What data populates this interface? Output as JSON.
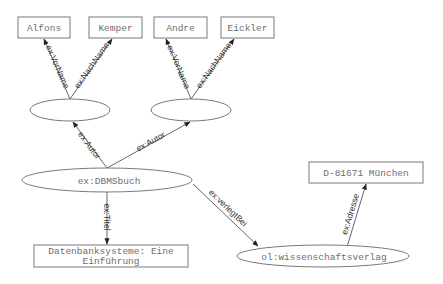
{
  "diagram": {
    "nodes": [
      {
        "id": "alfons",
        "shape": "rect",
        "label": "Alfons"
      },
      {
        "id": "kemper",
        "shape": "rect",
        "label": "Kemper"
      },
      {
        "id": "andre",
        "shape": "rect",
        "label": "Andre"
      },
      {
        "id": "eickler",
        "shape": "rect",
        "label": "Eickler"
      },
      {
        "id": "blank1",
        "shape": "ellipse",
        "label": ""
      },
      {
        "id": "blank2",
        "shape": "ellipse",
        "label": ""
      },
      {
        "id": "dbmsbuch",
        "shape": "ellipse",
        "label": "ex:DBMSbuch"
      },
      {
        "id": "titel",
        "shape": "rect",
        "label_lines": [
          "Datenbanksysteme: Eine",
          "Einführung"
        ]
      },
      {
        "id": "verlag",
        "shape": "ellipse",
        "label": "ol:wissenschaftsverlag"
      },
      {
        "id": "adresse",
        "shape": "rect",
        "label": "D-81671 München"
      }
    ],
    "edges": [
      {
        "from": "blank1",
        "to": "alfons",
        "label": "ex:VorName"
      },
      {
        "from": "blank1",
        "to": "kemper",
        "label": "ex:NachName"
      },
      {
        "from": "blank2",
        "to": "andre",
        "label": "ex:VorName"
      },
      {
        "from": "blank2",
        "to": "eickler",
        "label": "ex:NachName"
      },
      {
        "from": "dbmsbuch",
        "to": "blank1",
        "label": "ex:Autor"
      },
      {
        "from": "dbmsbuch",
        "to": "blank2",
        "label": "ex:Autor"
      },
      {
        "from": "dbmsbuch",
        "to": "titel",
        "label": "ex:Titel"
      },
      {
        "from": "dbmsbuch",
        "to": "verlag",
        "label": "ex:verlegtBei"
      },
      {
        "from": "verlag",
        "to": "adresse",
        "label": "ex:Adresse"
      }
    ]
  }
}
